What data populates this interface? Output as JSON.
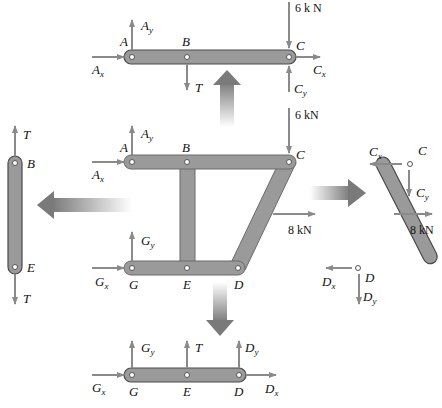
{
  "diagram": {
    "colors": {
      "member_fill": "#9a9a9a",
      "member_stroke": "#4a4a4a",
      "force_arrow": "#8a8a8a",
      "transition_arrow": "#7a7a7a",
      "text": "#111111"
    },
    "frame": {
      "joints": [
        "A",
        "B",
        "C",
        "G",
        "E",
        "D"
      ],
      "loads": {
        "C_vertical": "6 kN",
        "CD_horizontal": "8 kN"
      },
      "supports": {
        "A": [
          "A_x",
          "A_y"
        ],
        "G": [
          "G_x",
          "G_y"
        ]
      }
    },
    "member_ABC": {
      "joints": [
        "A",
        "B",
        "C"
      ],
      "load": "6 k N",
      "forces": [
        "A_x",
        "A_y",
        "T",
        "C_x",
        "C_y"
      ]
    },
    "member_BE": {
      "joints": [
        "B",
        "E"
      ],
      "forces": [
        "T",
        "T"
      ]
    },
    "member_CD": {
      "joints": [
        "C",
        "D"
      ],
      "load": "8 kN",
      "forces": [
        "C_x",
        "C_y",
        "D_x",
        "D_y"
      ]
    },
    "member_GED": {
      "joints": [
        "G",
        "E",
        "D"
      ],
      "forces": [
        "G_x",
        "G_y",
        "T",
        "D_x",
        "D_y"
      ]
    }
  },
  "labels": {
    "A": "A",
    "B": "B",
    "C": "C",
    "D": "D",
    "E": "E",
    "G": "G",
    "T": "T",
    "x": "x",
    "y": "y",
    "top_load": "6 k N",
    "frame_load_6": "6 kN",
    "frame_load_8": "8 kN",
    "cd_load_8": "8 kN"
  }
}
